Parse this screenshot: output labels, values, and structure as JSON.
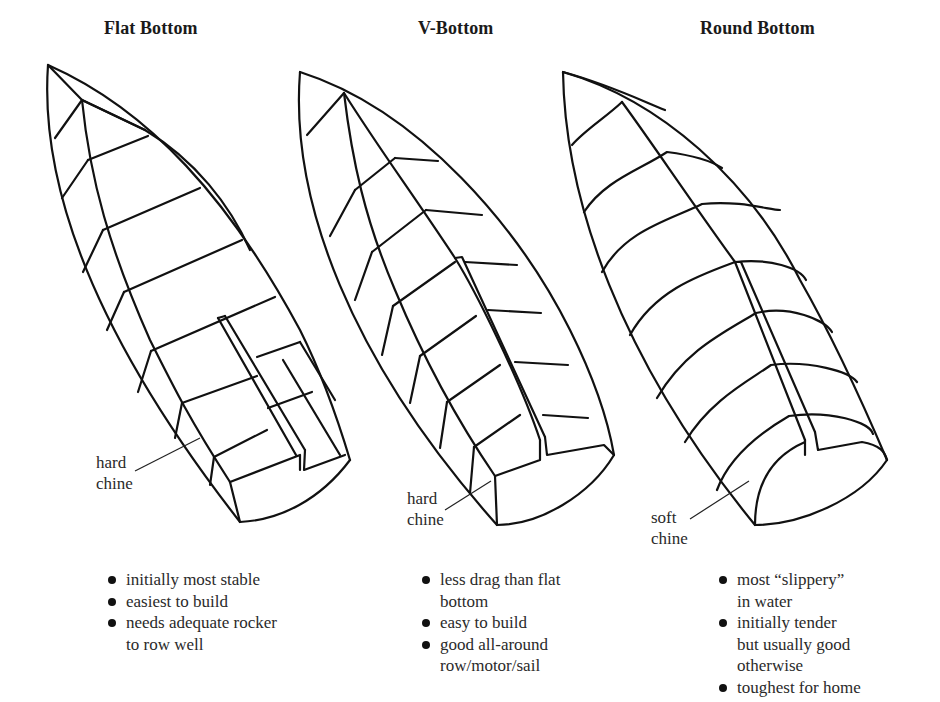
{
  "figure": {
    "panels": [
      {
        "id": "flat",
        "title": "Flat Bottom",
        "chine_label": [
          "hard",
          "chine"
        ],
        "notes": [
          {
            "lines": [
              "initially most stable"
            ]
          },
          {
            "lines": [
              "easiest to build"
            ]
          },
          {
            "lines": [
              "needs adequate rocker",
              "to row well"
            ]
          }
        ]
      },
      {
        "id": "v",
        "title": "V-Bottom",
        "chine_label": [
          "hard",
          "chine"
        ],
        "notes": [
          {
            "lines": [
              "less drag than flat",
              "bottom"
            ]
          },
          {
            "lines": [
              "easy to build"
            ]
          },
          {
            "lines": [
              "good all-around",
              "row/motor/sail"
            ]
          }
        ]
      },
      {
        "id": "round",
        "title": "Round Bottom",
        "chine_label": [
          "soft",
          "chine"
        ],
        "notes": [
          {
            "lines": [
              "most “slippery”",
              "in water"
            ]
          },
          {
            "lines": [
              "initially tender",
              "but usually good",
              "otherwise"
            ]
          },
          {
            "lines": [
              "toughest for home"
            ]
          }
        ]
      }
    ],
    "colors": {
      "line": "#111111",
      "text": "#2a2a2a",
      "background": "#ffffff"
    }
  }
}
